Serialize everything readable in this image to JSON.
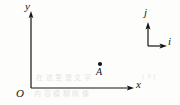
{
  "figure": {
    "kind": "coordinate-axes-diagram",
    "background_color": "#fdfdfb",
    "ink_color": "#141414"
  },
  "axes": {
    "origin_label": "O",
    "x_axis_label": "x",
    "y_axis_label": "y",
    "origin_px": [
      31,
      88
    ],
    "x_axis_end_px": [
      133,
      88
    ],
    "y_axis_top_px": [
      31,
      13
    ]
  },
  "point": {
    "label": "A",
    "position_px": [
      100,
      64
    ],
    "dot_radius_px": 2.1
  },
  "basis_vectors": {
    "j_label": "j",
    "i_label": "i",
    "corner_px": [
      148,
      46
    ],
    "j_tip_px": [
      148,
      24
    ],
    "i_tip_px": [
      167,
      46
    ]
  },
  "ghost_text": {
    "line1": "在 这 里 是 文 字",
    "line2": "内 容 模 糊 映 像",
    "line3": "[ 3 ]",
    "line4": "·"
  }
}
